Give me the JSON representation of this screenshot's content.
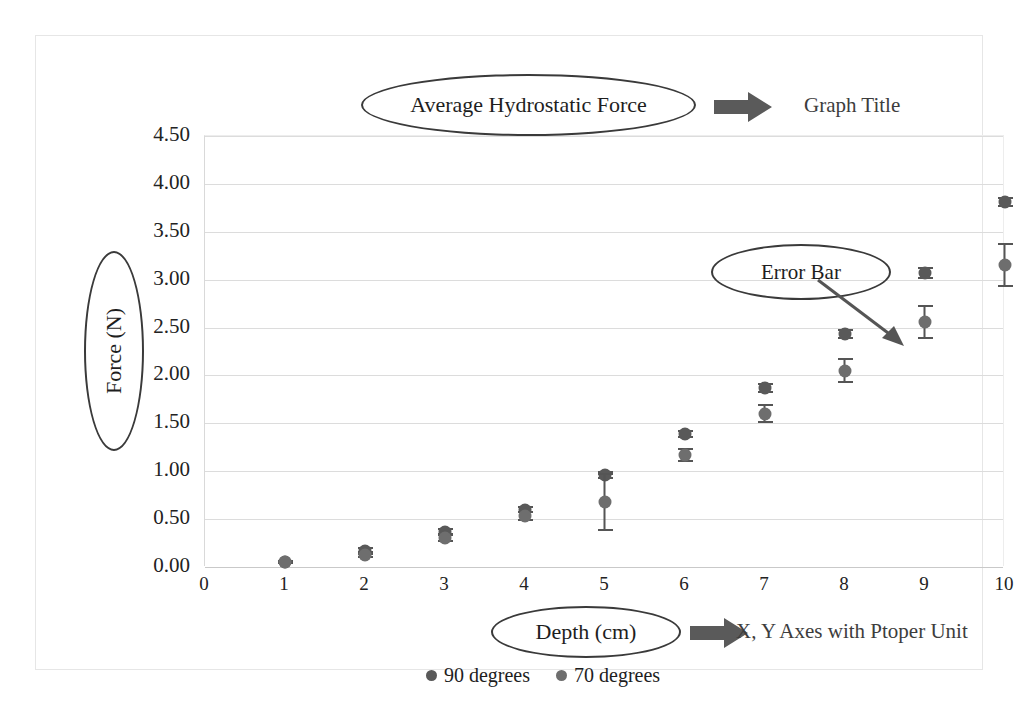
{
  "page": {
    "scan_artifact_text": "",
    "background": "#ffffff"
  },
  "annotations": {
    "title_ellipse_label": "Average Hydrostatic Force",
    "title_callout": "Graph Title",
    "ylabel_ellipse_label": "Force (N)",
    "xlabel_ellipse_label": "Depth (cm)",
    "axes_callout": "X, Y Axes with Ptoper Unit",
    "errorbar_ellipse_label": "Error Bar",
    "ellipse_color": "#3a3a3a",
    "arrow_color": "#5a5a5a",
    "callout_text_color": "#3d3d3d"
  },
  "legend": {
    "position": "bottom-center",
    "items": [
      {
        "label": "90 degrees",
        "color": "#595959"
      },
      {
        "label": "70 degrees",
        "color": "#6e6e6e"
      }
    ]
  },
  "chart_data": {
    "type": "scatter",
    "title": "Average Hydrostatic Force",
    "xlabel": "Depth (cm)",
    "ylabel": "Force (N)",
    "xlim": [
      0,
      10
    ],
    "ylim": [
      0,
      4.5
    ],
    "ytick_step": 0.5,
    "grid": true,
    "legend_position": "bottom-center",
    "x": [
      1,
      2,
      3,
      4,
      5,
      6,
      7,
      8,
      9,
      10
    ],
    "xtick_labels": [
      "0",
      "1",
      "2",
      "3",
      "4",
      "5",
      "6",
      "7",
      "8",
      "9",
      "10"
    ],
    "ytick_labels": [
      "0.00",
      "0.50",
      "1.00",
      "1.50",
      "2.00",
      "2.50",
      "3.00",
      "3.50",
      "4.00",
      "4.50"
    ],
    "series": [
      {
        "name": "90 degrees",
        "color": "#595959",
        "values": [
          0.05,
          0.17,
          0.37,
          0.6,
          0.96,
          1.39,
          1.87,
          2.43,
          3.07,
          3.81
        ],
        "errors": [
          0.02,
          0.04,
          0.04,
          0.04,
          0.04,
          0.04,
          0.05,
          0.05,
          0.06,
          0.05
        ]
      },
      {
        "name": "70 degrees",
        "color": "#6e6e6e",
        "values": [
          0.05,
          0.13,
          0.3,
          0.53,
          0.68,
          1.17,
          1.6,
          2.05,
          2.56,
          3.15
        ],
        "errors": [
          0.02,
          0.04,
          0.04,
          0.05,
          0.3,
          0.07,
          0.1,
          0.13,
          0.18,
          0.23
        ]
      }
    ]
  }
}
